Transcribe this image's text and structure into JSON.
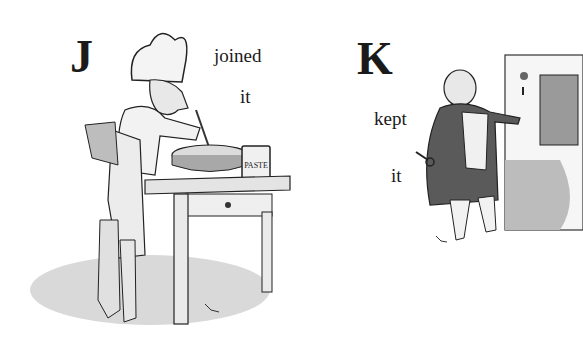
{
  "illustration": {
    "left_panel": {
      "letter": "J",
      "verb": "joined",
      "object": "it",
      "scene": "chef brushing pastry on a pie at a table beside a jar",
      "jar_label": "PASTE",
      "signature": "monogram"
    },
    "right_panel": {
      "letter": "K",
      "verb": "kept",
      "object": "it",
      "scene": "stout man in frock coat holding a key beside a door",
      "signature": "monogram"
    },
    "colors": {
      "background": "#ffffff",
      "ink": "#1a1a1a"
    }
  }
}
